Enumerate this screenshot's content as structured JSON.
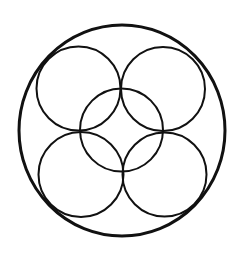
{
  "diagram": {
    "title": "",
    "background": "#ffffff",
    "stroke_color": "#111111",
    "outer_circle": {
      "cx": 122,
      "cy": 130.5,
      "rx": 103,
      "ry": 105.5,
      "stroke_width": 3
    },
    "inner_circles": [
      {
        "name": "top-left",
        "cx": 78.5,
        "cy": 88.5,
        "r": 42,
        "stroke_width": 2
      },
      {
        "name": "top-right",
        "cx": 163,
        "cy": 89,
        "r": 42,
        "stroke_width": 2
      },
      {
        "name": "center",
        "cx": 121.5,
        "cy": 130,
        "r": 41.5,
        "stroke_width": 2
      },
      {
        "name": "bottom-left",
        "cx": 81,
        "cy": 174.5,
        "r": 42.5,
        "stroke_width": 2
      },
      {
        "name": "bottom-right",
        "cx": 164.5,
        "cy": 174.5,
        "r": 42,
        "stroke_width": 2
      }
    ]
  }
}
